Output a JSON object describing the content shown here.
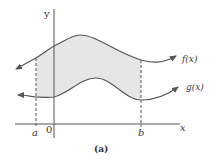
{
  "figure": {
    "caption": "(a)",
    "axes": {
      "x_label": "x",
      "y_label": "y",
      "origin_label": "0"
    },
    "bounds": {
      "left_label": "a",
      "right_label": "b"
    },
    "curves": [
      {
        "name": "upper",
        "label": "f(x)"
      },
      {
        "name": "lower",
        "label": "g(x)"
      }
    ],
    "shaded_region": "area between f(x) and g(x) from a to b",
    "colors": {
      "stroke": "#555555",
      "fill": "#e6e6e6",
      "text": "#3a3a3a"
    }
  }
}
